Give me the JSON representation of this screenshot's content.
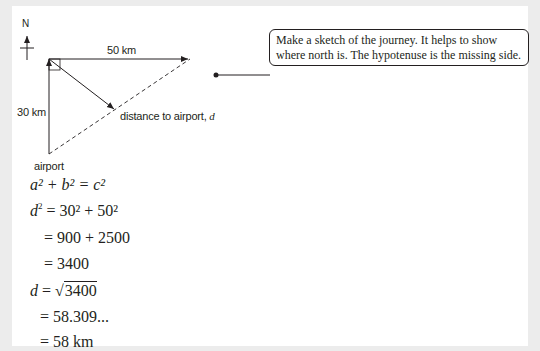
{
  "diagram": {
    "compass_label": "N",
    "top_side_label": "50 km",
    "left_side_label": "30 km",
    "diagonal_label": "distance to airport, ",
    "diagonal_var": "d",
    "start_label": "airport"
  },
  "callout": {
    "text": "Make a sketch of the journey. It helps to show where north is. The hypotenuse is the missing side."
  },
  "working": {
    "line1": "a² + b² = c²",
    "line2_lhs": "d",
    "line2_rhs": " = 30² + 50²",
    "line3": "= 900 + 2500",
    "line4": "= 3400",
    "line5_lhs": "d",
    "line5_eq": " = √",
    "line5_rad": "3400",
    "line6": "= 58.309...",
    "line7": "= 58 km"
  }
}
